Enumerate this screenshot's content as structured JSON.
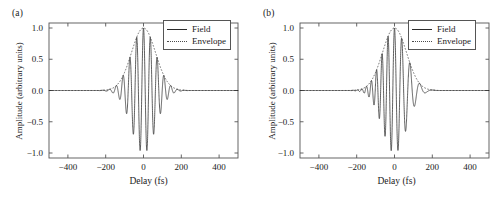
{
  "figure": {
    "background": "#ffffff",
    "line_color": "#2b2b2b",
    "envelope_color": "#4a4a4a",
    "axis_color": "#555555"
  },
  "panels": [
    {
      "label": "(a)",
      "name": "panel-a",
      "legend": {
        "items": [
          {
            "label": "Field",
            "style": "solid"
          },
          {
            "label": "Envelope",
            "style": "dotted"
          }
        ]
      }
    },
    {
      "label": "(b)",
      "name": "panel-b",
      "legend": {
        "items": [
          {
            "label": "Field",
            "style": "solid"
          },
          {
            "label": "Envelope",
            "style": "dotted"
          }
        ]
      }
    }
  ],
  "axes": {
    "xlabel": "Delay (fs)",
    "ylabel": "Amplitude (arbitrary units)",
    "xticks": [
      -400,
      -200,
      0,
      200,
      400
    ],
    "xtick_labels": [
      "−400",
      "−200",
      "0",
      "200",
      "400"
    ],
    "yticks": [
      1.0,
      0.5,
      0.0,
      -0.5,
      -1.0
    ],
    "ytick_labels": [
      "1.0",
      "0.5",
      "0.0",
      "−0.5",
      "−1.0"
    ],
    "xlim": [
      -500,
      500
    ],
    "ylim": [
      -1.08,
      1.08
    ],
    "grid": false
  },
  "chart_data": [
    {
      "type": "line",
      "title": "(a)",
      "xlabel": "Delay (fs)",
      "ylabel": "Amplitude (arbitrary units)",
      "xlim": [
        -500,
        500
      ],
      "ylim": [
        -1.08,
        1.08
      ],
      "grid": false,
      "legend_position": "upper right",
      "description": "Transform-limited (unchirped) ultrashort pulse: Gaussian envelope with constant-frequency carrier oscillation.",
      "model": {
        "envelope": "gaussian",
        "envelope_fwhm_fs": 150,
        "envelope_sigma_fs": 63.7,
        "carrier_period_fs": 36,
        "carrier_frequency_per_fs": 0.02778,
        "chirp_per_fs2": 0,
        "carrier_envelope_phase_rad": 0
      },
      "series": [
        {
          "name": "Field",
          "style": "solid",
          "color": "#2b2b2b",
          "x": [
            -500,
            -460,
            -420,
            -380,
            -340,
            -300,
            -280,
            -260,
            -240,
            -230,
            -220,
            -210,
            -200,
            -190,
            -180,
            -170,
            -160,
            -150,
            -140,
            -130,
            -120,
            -110,
            -100,
            -90,
            -80,
            -72,
            -63,
            -54,
            -45,
            -36,
            -27,
            -18,
            -9,
            0,
            9,
            18,
            27,
            36,
            45,
            54,
            63,
            72,
            80,
            90,
            100,
            110,
            120,
            130,
            140,
            150,
            160,
            170,
            180,
            190,
            200,
            210,
            220,
            240,
            260,
            280,
            320,
            360,
            400,
            460,
            500
          ],
          "y": [
            0.0,
            0.0,
            0.0,
            0.0,
            0.0,
            0.001,
            0.002,
            0.004,
            -0.008,
            0.013,
            0.017,
            -0.024,
            0.032,
            0.041,
            -0.053,
            0.066,
            0.081,
            -0.098,
            0.117,
            0.138,
            -0.161,
            0.186,
            0.213,
            -0.242,
            0.272,
            0.0,
            -0.336,
            0.0,
            0.436,
            0.0,
            -0.746,
            0.0,
            0.962,
            1.0,
            0.962,
            0.0,
            -0.895,
            0.0,
            0.616,
            0.0,
            -0.336,
            0.0,
            0.272,
            -0.242,
            0.213,
            0.186,
            -0.161,
            0.138,
            0.117,
            -0.098,
            0.081,
            0.066,
            -0.053,
            0.041,
            0.032,
            -0.024,
            0.017,
            0.008,
            0.004,
            0.002,
            0.0,
            0.0,
            0.0,
            0.0,
            0.0
          ]
        },
        {
          "name": "Envelope",
          "style": "dotted",
          "color": "#4a4a4a",
          "x": [
            -500,
            -400,
            -300,
            -260,
            -240,
            -220,
            -200,
            -180,
            -160,
            -140,
            -120,
            -100,
            -80,
            -60,
            -40,
            -20,
            0,
            20,
            40,
            60,
            80,
            100,
            120,
            140,
            160,
            180,
            200,
            220,
            240,
            260,
            300,
            400,
            500
          ],
          "y": [
            0.0,
            0.0,
            0.001,
            0.004,
            0.008,
            0.017,
            0.032,
            0.053,
            0.081,
            0.117,
            0.161,
            0.213,
            0.272,
            0.336,
            0.436,
            0.746,
            1.0,
            0.895,
            0.616,
            0.336,
            0.272,
            0.213,
            0.161,
            0.117,
            0.081,
            0.053,
            0.032,
            0.017,
            0.008,
            0.004,
            0.001,
            0.0,
            0.0
          ]
        }
      ]
    },
    {
      "type": "line",
      "title": "(b)",
      "xlabel": "Delay (fs)",
      "ylabel": "Amplitude (arbitrary units)",
      "xlim": [
        -500,
        500
      ],
      "ylim": [
        -1.08,
        1.08
      ],
      "grid": false,
      "legend_position": "upper right",
      "description": "Chirped ultrashort pulse: same Gaussian envelope but the carrier frequency decreases with delay, so oscillations are dense on the leading (negative-delay) side and sparse on the trailing (positive-delay) side.",
      "model": {
        "envelope": "gaussian",
        "envelope_fwhm_fs": 150,
        "envelope_sigma_fs": 63.7,
        "carrier_period_at_zero_fs": 36,
        "carrier_frequency_per_fs": 0.02778,
        "chirp_per_fs2": -8e-05,
        "carrier_envelope_phase_rad": 0
      },
      "series": [
        {
          "name": "Field",
          "style": "solid",
          "color": "#2b2b2b",
          "x": [
            -500,
            -440,
            -380,
            -320,
            -280,
            -250,
            -235,
            -222,
            -210,
            -198,
            -187,
            -176,
            -166,
            -156,
            -146,
            -136,
            -126,
            -116,
            -106,
            -96,
            -86,
            -76,
            -66,
            -56,
            -46,
            -36,
            -26,
            -14,
            0,
            14,
            28,
            44,
            62,
            82,
            104,
            128,
            152,
            176,
            198,
            218,
            236,
            260,
            300,
            360,
            420,
            500
          ],
          "y": [
            0.0,
            0.0,
            0.0,
            0.001,
            0.003,
            0.007,
            -0.011,
            0.015,
            -0.021,
            0.028,
            -0.037,
            0.049,
            -0.063,
            0.081,
            -0.102,
            0.127,
            -0.156,
            0.19,
            -0.229,
            0.272,
            -0.32,
            0.395,
            -0.52,
            0.66,
            -0.82,
            0.905,
            -0.96,
            0.99,
            1.0,
            -0.875,
            0.62,
            -0.5,
            0.305,
            -0.2,
            0.13,
            -0.26,
            0.08,
            -0.03,
            0.012,
            -0.005,
            0.002,
            0.001,
            0.0,
            0.0,
            0.0,
            0.0
          ]
        },
        {
          "name": "Envelope",
          "style": "dotted",
          "color": "#4a4a4a",
          "x": [
            -500,
            -400,
            -300,
            -260,
            -240,
            -220,
            -200,
            -180,
            -160,
            -140,
            -120,
            -100,
            -80,
            -60,
            -40,
            -20,
            0,
            20,
            40,
            60,
            80,
            100,
            120,
            140,
            160,
            180,
            200,
            220,
            240,
            260,
            300,
            400,
            500
          ],
          "y": [
            0.0,
            0.0,
            0.001,
            0.004,
            0.008,
            0.017,
            0.032,
            0.053,
            0.081,
            0.117,
            0.161,
            0.213,
            0.272,
            0.395,
            0.66,
            0.905,
            1.0,
            0.875,
            0.62,
            0.5,
            0.305,
            0.2,
            0.13,
            0.26,
            0.08,
            0.053,
            0.032,
            0.017,
            0.008,
            0.004,
            0.001,
            0.0,
            0.0
          ]
        }
      ]
    }
  ]
}
